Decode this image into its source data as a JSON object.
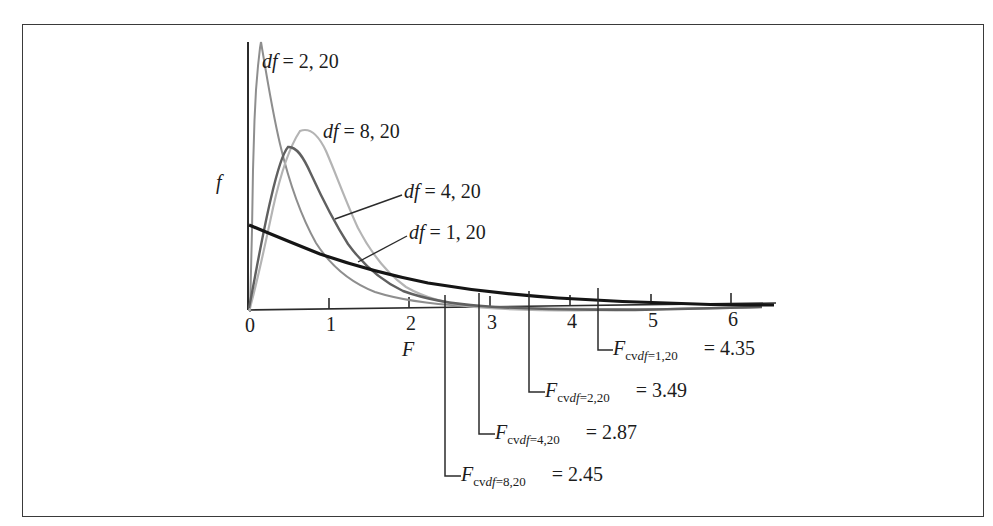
{
  "figure": {
    "background_color": "#ffffff",
    "frame_color": "#3a3a3a",
    "axis_color": "#2b2b2b"
  },
  "axes": {
    "x_label": "F",
    "y_label": "f",
    "x_ticks": [
      "0",
      "1",
      "2",
      "3",
      "4",
      "5",
      "6"
    ],
    "x_tick_values": [
      0,
      1,
      2,
      3,
      4,
      5,
      6
    ],
    "x_range": [
      0,
      6.6
    ],
    "y_range": [
      0,
      1.0
    ]
  },
  "curve_labels": [
    {
      "id": "df-2-20",
      "text": "df = 2, 20",
      "df": "2, 20"
    },
    {
      "id": "df-8-20",
      "text": "df = 8, 20",
      "df": "8, 20"
    },
    {
      "id": "df-4-20",
      "text": "df = 4, 20",
      "df": "4, 20"
    },
    {
      "id": "df-1-20",
      "text": "df = 1, 20",
      "df": "1, 20"
    }
  ],
  "critical_values": [
    {
      "id": "cv-1-20",
      "base": "F",
      "cv": "cv",
      "df": "df",
      "eq": "=",
      "params": "1,20",
      "equals": "=",
      "value": "4.35",
      "x": 4.35
    },
    {
      "id": "cv-2-20",
      "base": "F",
      "cv": "cv",
      "df": "df",
      "eq": "=",
      "params": "2,20",
      "equals": "=",
      "value": "3.49",
      "x": 3.49
    },
    {
      "id": "cv-4-20",
      "base": "F",
      "cv": "cv",
      "df": "df",
      "eq": "=",
      "params": "4,20",
      "equals": "=",
      "value": "2.87",
      "x": 2.87
    },
    {
      "id": "cv-8-20",
      "base": "F",
      "cv": "cv",
      "df": "df",
      "eq": "=",
      "params": "8,20",
      "equals": "=",
      "value": "2.45",
      "x": 2.45
    }
  ],
  "chart_data": {
    "type": "line",
    "title": "",
    "subtitle": "",
    "xlabel": "F",
    "ylabel": "f",
    "xlim": [
      0,
      6.6
    ],
    "ylim": [
      0,
      1.0
    ],
    "grid": false,
    "legend": "inline-annotations",
    "x_ticks": [
      0,
      1,
      2,
      3,
      4,
      5,
      6
    ],
    "series": [
      {
        "name": "df = 2, 20",
        "color": "#8e8e8e",
        "width": 2.0,
        "peak_x": 0.0,
        "peak_y": 1.0,
        "note": "monotone decreasing from very high value at x=0",
        "points": [
          [
            0.02,
            1.02
          ],
          [
            0.05,
            0.96
          ],
          [
            0.1,
            0.88
          ],
          [
            0.15,
            0.81
          ],
          [
            0.2,
            0.75
          ],
          [
            0.3,
            0.64
          ],
          [
            0.4,
            0.55
          ],
          [
            0.5,
            0.47
          ],
          [
            0.6,
            0.41
          ],
          [
            0.8,
            0.31
          ],
          [
            1.0,
            0.24
          ],
          [
            1.25,
            0.175
          ],
          [
            1.5,
            0.13
          ],
          [
            1.75,
            0.098
          ],
          [
            2.0,
            0.074
          ],
          [
            2.5,
            0.043
          ],
          [
            3.0,
            0.026
          ],
          [
            3.5,
            0.016
          ],
          [
            4.0,
            0.01
          ],
          [
            4.5,
            0.0065
          ],
          [
            5.0,
            0.004
          ],
          [
            5.5,
            0.0027
          ],
          [
            6.0,
            0.0018
          ],
          [
            6.5,
            0.0012
          ]
        ]
      },
      {
        "name": "df = 8, 20",
        "color": "#b4b4b4",
        "width": 2.2,
        "peak_x": 0.66,
        "peak_y": 0.7,
        "points": [
          [
            0.02,
            0.02
          ],
          [
            0.08,
            0.14
          ],
          [
            0.15,
            0.3
          ],
          [
            0.22,
            0.43
          ],
          [
            0.3,
            0.54
          ],
          [
            0.4,
            0.63
          ],
          [
            0.5,
            0.68
          ],
          [
            0.6,
            0.7
          ],
          [
            0.66,
            0.7
          ],
          [
            0.75,
            0.69
          ],
          [
            0.9,
            0.64
          ],
          [
            1.05,
            0.58
          ],
          [
            1.2,
            0.51
          ],
          [
            1.4,
            0.42
          ],
          [
            1.6,
            0.34
          ],
          [
            1.8,
            0.27
          ],
          [
            2.0,
            0.215
          ],
          [
            2.25,
            0.16
          ],
          [
            2.5,
            0.118
          ],
          [
            2.8,
            0.082
          ],
          [
            3.1,
            0.057
          ],
          [
            3.5,
            0.035
          ],
          [
            4.0,
            0.019
          ],
          [
            4.5,
            0.011
          ],
          [
            5.0,
            0.006
          ],
          [
            5.5,
            0.0035
          ],
          [
            6.0,
            0.002
          ],
          [
            6.5,
            0.0012
          ]
        ]
      },
      {
        "name": "df = 4, 20",
        "color": "#606060",
        "width": 2.4,
        "peak_x": 0.45,
        "peak_y": 0.63,
        "points": [
          [
            0.02,
            0.07
          ],
          [
            0.06,
            0.2
          ],
          [
            0.12,
            0.36
          ],
          [
            0.18,
            0.47
          ],
          [
            0.25,
            0.55
          ],
          [
            0.32,
            0.6
          ],
          [
            0.4,
            0.625
          ],
          [
            0.45,
            0.63
          ],
          [
            0.55,
            0.62
          ],
          [
            0.68,
            0.585
          ],
          [
            0.82,
            0.54
          ],
          [
            1.0,
            0.47
          ],
          [
            1.2,
            0.4
          ],
          [
            1.4,
            0.335
          ],
          [
            1.6,
            0.28
          ],
          [
            1.85,
            0.22
          ],
          [
            2.1,
            0.175
          ],
          [
            2.4,
            0.132
          ],
          [
            2.7,
            0.1
          ],
          [
            3.0,
            0.077
          ],
          [
            3.4,
            0.054
          ],
          [
            3.8,
            0.038
          ],
          [
            4.3,
            0.025
          ],
          [
            4.8,
            0.017
          ],
          [
            5.3,
            0.011
          ],
          [
            5.8,
            0.0075
          ],
          [
            6.3,
            0.005
          ],
          [
            6.55,
            0.004
          ]
        ]
      },
      {
        "name": "df = 1, 20",
        "color": "#151515",
        "width": 3.2,
        "peak_x": 0.0,
        "peak_y": 0.32,
        "note": "thick black, starts mid-left and decays slowly",
        "points": [
          [
            0.02,
            0.315
          ],
          [
            0.1,
            0.3
          ],
          [
            0.2,
            0.285
          ],
          [
            0.35,
            0.262
          ],
          [
            0.5,
            0.243
          ],
          [
            0.7,
            0.22
          ],
          [
            0.9,
            0.2
          ],
          [
            1.15,
            0.178
          ],
          [
            1.4,
            0.159
          ],
          [
            1.7,
            0.139
          ],
          [
            2.0,
            0.122
          ],
          [
            2.35,
            0.106
          ],
          [
            2.7,
            0.092
          ],
          [
            3.1,
            0.079
          ],
          [
            3.5,
            0.068
          ],
          [
            4.0,
            0.057
          ],
          [
            4.5,
            0.048
          ],
          [
            5.0,
            0.041
          ],
          [
            5.5,
            0.035
          ],
          [
            6.0,
            0.03
          ],
          [
            6.55,
            0.026
          ]
        ]
      }
    ],
    "annotations": [
      {
        "text": "df = 2, 20",
        "x": 0.17,
        "y": 0.95
      },
      {
        "text": "df = 8, 20",
        "x": 0.95,
        "y": 0.73
      },
      {
        "text": "df = 4, 20",
        "x": 1.55,
        "y": 0.48
      },
      {
        "text": "df = 1, 20",
        "x": 2.1,
        "y": 0.315
      },
      {
        "text": "Fcv df=1,20 = 4.35",
        "x": 4.35,
        "y": 0
      },
      {
        "text": "Fcv df=2,20 = 3.49",
        "x": 3.49,
        "y": 0
      },
      {
        "text": "Fcv df=4,20 = 2.87",
        "x": 2.87,
        "y": 0
      },
      {
        "text": "Fcv df=8,20 = 2.45",
        "x": 2.45,
        "y": 0
      }
    ]
  }
}
